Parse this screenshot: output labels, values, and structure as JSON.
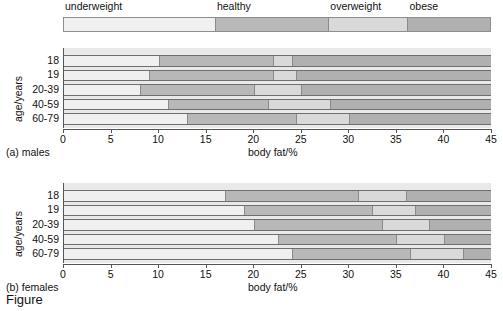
{
  "figure": {
    "caption": "Figure"
  },
  "legend": {
    "name": "bmi-category-legend",
    "categories": [
      {
        "label": "underweight",
        "color": "#f0f0f0"
      },
      {
        "label": "healthy",
        "color": "#b8b8b8"
      },
      {
        "label": "overweight",
        "color": "#d9d9d9"
      },
      {
        "label": "obese",
        "color": "#b0b0b0"
      }
    ]
  },
  "axis": {
    "xlabel": "body fat/%",
    "ylabel": "age/years",
    "xticks": [
      "0",
      "5",
      "10",
      "15",
      "20",
      "25",
      "30",
      "35",
      "40",
      "45"
    ],
    "xmin": 0,
    "xmax": 45,
    "xstep": 5
  },
  "panels": [
    {
      "key": "males",
      "caption": "(a) males"
    },
    {
      "key": "females",
      "caption": "(b) females"
    }
  ],
  "chart_data": {
    "type": "bar",
    "orientation": "horizontal",
    "stacked": true,
    "xlabel": "body fat/%",
    "ylabel": "age/years",
    "xlim": [
      0,
      45
    ],
    "xticks": [
      0,
      5,
      10,
      15,
      20,
      25,
      30,
      35,
      40,
      45
    ],
    "grid": false,
    "legend_position": "top",
    "series": [
      {
        "name": "underweight",
        "color": "#f0f0f0"
      },
      {
        "name": "healthy",
        "color": "#b8b8b8"
      },
      {
        "name": "overweight",
        "color": "#d9d9d9"
      },
      {
        "name": "obese",
        "color": "#b0b0b0"
      }
    ],
    "panels": [
      {
        "name": "(a) males",
        "categories": [
          "18",
          "19",
          "20-39",
          "40-59",
          "60-79"
        ],
        "boundaries": [
          [
            0,
            10.0,
            22.0,
            24.0,
            45
          ],
          [
            0,
            9.0,
            22.0,
            24.5,
            45
          ],
          [
            0,
            8.0,
            20.0,
            25.0,
            45
          ],
          [
            0,
            11.0,
            21.5,
            28.0,
            45
          ],
          [
            0,
            13.0,
            24.5,
            30.0,
            45
          ]
        ],
        "values": {
          "underweight": [
            10.0,
            9.0,
            8.0,
            11.0,
            13.0
          ],
          "healthy": [
            12.0,
            13.0,
            12.0,
            10.5,
            11.5
          ],
          "overweight": [
            2.0,
            2.5,
            5.0,
            6.5,
            5.5
          ],
          "obese": [
            21.0,
            20.5,
            20.0,
            17.0,
            15.0
          ]
        }
      },
      {
        "name": "(b) females",
        "categories": [
          "18",
          "19",
          "20-39",
          "40-59",
          "60-79"
        ],
        "boundaries": [
          [
            0,
            17.0,
            31.0,
            36.0,
            45
          ],
          [
            0,
            19.0,
            32.5,
            37.0,
            45
          ],
          [
            0,
            20.0,
            33.5,
            38.5,
            45
          ],
          [
            0,
            22.5,
            35.0,
            40.0,
            45
          ],
          [
            0,
            24.0,
            36.5,
            42.0,
            45
          ]
        ],
        "values": {
          "underweight": [
            17.0,
            19.0,
            20.0,
            22.5,
            24.0
          ],
          "healthy": [
            14.0,
            13.5,
            13.5,
            12.5,
            12.5
          ],
          "overweight": [
            5.0,
            4.5,
            5.0,
            5.0,
            5.5
          ],
          "obese": [
            9.0,
            8.0,
            6.5,
            5.0,
            3.0
          ]
        }
      }
    ]
  }
}
